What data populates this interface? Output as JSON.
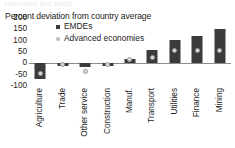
{
  "top_remnant_text": "comomics and briefs",
  "chart_data": {
    "type": "bar",
    "title": "Percent deviation from country average",
    "subtitle": "",
    "xlabel": "",
    "ylabel": "",
    "ylim": [
      -100,
      200
    ],
    "yticks": [
      200,
      150,
      100,
      50,
      0,
      -50,
      -100
    ],
    "ytick_labels": [
      "200",
      "150",
      "100",
      "50",
      "0",
      "-50",
      "-100"
    ],
    "grid": false,
    "legend_position": "top-center",
    "categories": [
      "Agriculture",
      "Trade",
      "Other service",
      "Construction",
      "Manuf.",
      "Transport",
      "Utilities",
      "Finance",
      "Mining"
    ],
    "series": [
      {
        "name": "EMDEs",
        "marker": "bar",
        "color": "#3b3b3b",
        "values": [
          -70,
          -12,
          -15,
          -13,
          20,
          57,
          105,
          120,
          152
        ]
      },
      {
        "name": "Advanced economies",
        "marker": "dot",
        "color": "#d9d9d9",
        "values": [
          -45,
          -5,
          -38,
          -5,
          18,
          25,
          57,
          58,
          58
        ]
      }
    ]
  },
  "colors": {
    "emde_bar": "#3b3b3b",
    "advanced_dot": "#d9d9d9",
    "advanced_dot_edge": "#9a9a9a",
    "axis": "#8d8d8d",
    "text": "#1c1c1c",
    "background": "#ffffff"
  }
}
